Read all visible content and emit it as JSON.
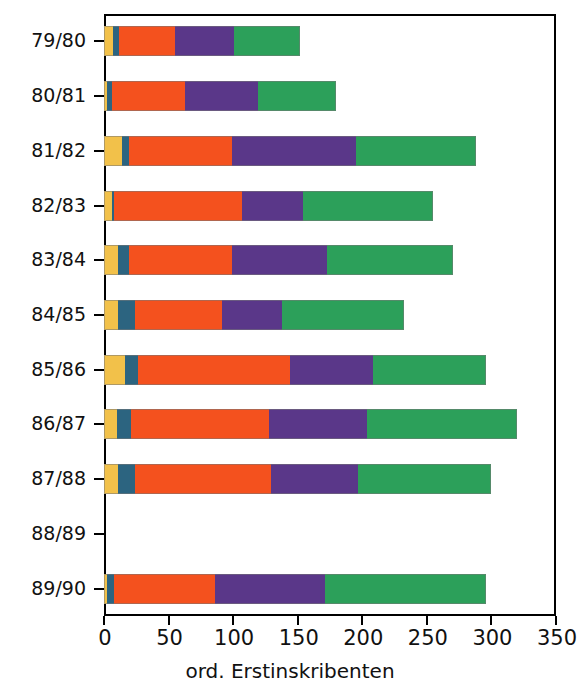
{
  "chart_data": {
    "type": "bar",
    "orientation": "horizontal",
    "stacked": true,
    "title": "",
    "xlabel": "ord. Erstinskribenten",
    "ylabel": "",
    "xlim": [
      0,
      350
    ],
    "ylim": null,
    "grid": false,
    "legend": null,
    "xticks": [
      0,
      50,
      100,
      150,
      200,
      250,
      300,
      350
    ],
    "xticklabels": [
      "0",
      "50",
      "100",
      "150",
      "200",
      "250",
      "300",
      "350"
    ],
    "categories": [
      "79/80",
      "80/81",
      "81/82",
      "82/83",
      "83/84",
      "84/85",
      "85/86",
      "86/87",
      "87/88",
      "88/89",
      "89/90"
    ],
    "series": [
      {
        "name": "segment-1",
        "color": "#f2c14a",
        "values": [
          7,
          2,
          14,
          6,
          11,
          11,
          16,
          10,
          11,
          0,
          2
        ]
      },
      {
        "name": "segment-2",
        "color": "#2c6480",
        "values": [
          5,
          4,
          5,
          2,
          8,
          13,
          10,
          11,
          13,
          0,
          6
        ]
      },
      {
        "name": "segment-3",
        "color": "#f4511e",
        "values": [
          43,
          57,
          80,
          99,
          80,
          67,
          118,
          107,
          105,
          0,
          78
        ]
      },
      {
        "name": "segment-4",
        "color": "#5a3789",
        "values": [
          46,
          56,
          96,
          47,
          74,
          47,
          64,
          76,
          68,
          0,
          85
        ]
      },
      {
        "name": "segment-5",
        "color": "#2ca05a",
        "values": [
          51,
          61,
          93,
          101,
          97,
          94,
          88,
          116,
          103,
          0,
          125
        ]
      }
    ],
    "segment_cumulative_ends": {
      "79/80": [
        7,
        12,
        55,
        101,
        152
      ],
      "80/81": [
        2,
        6,
        63,
        119,
        180
      ],
      "81/82": [
        14,
        19,
        99,
        195,
        288
      ],
      "82/83": [
        6,
        8,
        107,
        154,
        255
      ],
      "83/84": [
        11,
        19,
        99,
        173,
        270
      ],
      "84/85": [
        11,
        24,
        91,
        138,
        232
      ],
      "85/86": [
        16,
        26,
        144,
        208,
        296
      ],
      "86/87": [
        10,
        21,
        128,
        204,
        320
      ],
      "87/88": [
        11,
        24,
        129,
        197,
        300
      ],
      "88/89": [
        0,
        0,
        0,
        0,
        0
      ],
      "89/90": [
        2,
        8,
        86,
        171,
        296
      ]
    },
    "totals": [
      152,
      180,
      288,
      255,
      270,
      232,
      296,
      320,
      300,
      0,
      296
    ]
  },
  "axes": {
    "x_title": "ord. Erstinskribenten"
  }
}
